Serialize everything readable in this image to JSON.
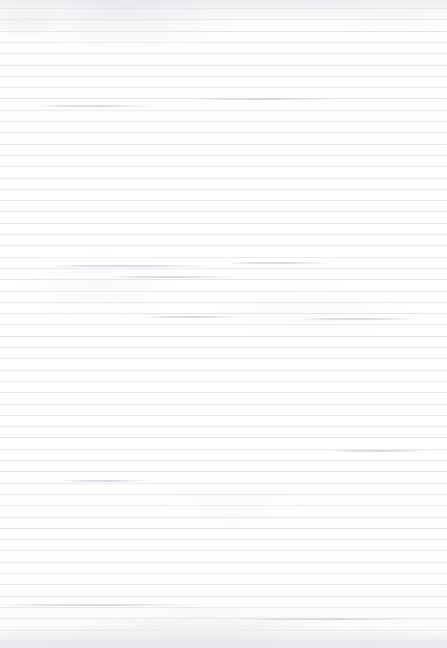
{
  "document": {
    "kind": "scanned-ruled-paper",
    "description": "Blank lined notebook page scan",
    "width": 447,
    "height": 648,
    "text_content": "",
    "has_handwriting": false,
    "has_printed_text": false
  },
  "paper": {
    "background_color": "#ffffff",
    "base_tone_color": "#fefefe",
    "grain_opacity": 0.35
  },
  "rules": {
    "line_color": "#e2e4e8",
    "line_thickness_px": 1,
    "spacing_px": 11.3,
    "first_line_y_px": 8,
    "line_count": 57,
    "full_bleed": true,
    "vertical_margin_rule": false
  },
  "artifacts": {
    "top_band": {
      "color": "#e2e4e9",
      "height_px": 10
    },
    "bottom_band": {
      "color": "#e0e2e7",
      "height_px": 16
    },
    "streaks": [
      {
        "x": 48,
        "y": 265,
        "width": 170
      },
      {
        "x": 112,
        "y": 276,
        "width": 126
      },
      {
        "x": 228,
        "y": 262,
        "width": 104
      },
      {
        "x": 300,
        "y": 318,
        "width": 120
      },
      {
        "x": 146,
        "y": 316,
        "width": 96
      },
      {
        "x": 62,
        "y": 480,
        "width": 88
      },
      {
        "x": 330,
        "y": 450,
        "width": 102
      },
      {
        "x": 0,
        "y": 604,
        "width": 200
      },
      {
        "x": 240,
        "y": 618,
        "width": 180
      },
      {
        "x": 36,
        "y": 105,
        "width": 120
      },
      {
        "x": 196,
        "y": 98,
        "width": 140
      }
    ]
  }
}
